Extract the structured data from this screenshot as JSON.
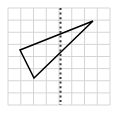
{
  "figure": {
    "type": "geometry-diagram",
    "canvas": {
      "width": 119,
      "height": 113,
      "background": "#ffffff"
    },
    "grid": {
      "name": "square-grid",
      "columns": 8,
      "rows": 8,
      "x_start": 8,
      "y_start": 8,
      "x_end": 110,
      "y_end": 105,
      "cell_width": 12.75,
      "cell_height": 12.125,
      "line_color": "#d5d5d5",
      "line_width": 1,
      "visible": true
    },
    "mirror_line": {
      "name": "line-of-symmetry",
      "orientation": "vertical",
      "x": 60.5,
      "y_top": 8,
      "y_bottom": 105,
      "style": "dashed",
      "color": "#3a3a3a",
      "line_width": 2,
      "dash_length": 2,
      "gap_length": 2.6,
      "grid_column_index": 4
    },
    "shapes": [
      {
        "name": "triangle",
        "kind": "polygon",
        "closed": true,
        "fill": "none",
        "stroke": "#000000",
        "stroke_width": 1.5,
        "vertices": [
          {
            "label": "A",
            "x": 20,
            "y": 50
          },
          {
            "label": "B",
            "x": 93,
            "y": 21
          },
          {
            "label": "C",
            "x": 34,
            "y": 78
          }
        ],
        "grid_vertices": [
          {
            "label": "A",
            "col": 0.95,
            "row": 3.46
          },
          {
            "label": "B",
            "col": 6.67,
            "row": 1.07
          },
          {
            "label": "C",
            "col": 2.04,
            "row": 5.77
          }
        ]
      }
    ],
    "labels": [],
    "annotations": []
  },
  "chart_data": {
    "type": "scatter",
    "title": "",
    "xlabel": "",
    "ylabel": "",
    "xlim": [
      0,
      8
    ],
    "ylim": [
      0,
      8
    ],
    "grid": true,
    "legend": "none",
    "series": [
      {
        "name": "triangle",
        "mode": "lines-closed",
        "x": [
          0.95,
          6.67,
          2.04
        ],
        "y": [
          4.54,
          6.93,
          2.23
        ]
      },
      {
        "name": "line-of-symmetry",
        "mode": "lines-dashed",
        "x": [
          4.12,
          4.12
        ],
        "y": [
          0,
          8
        ]
      }
    ]
  }
}
